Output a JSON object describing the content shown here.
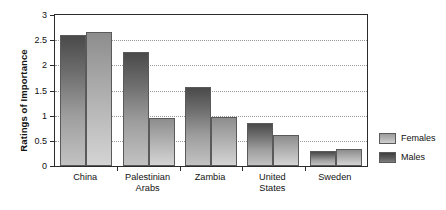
{
  "chart_data": {
    "type": "bar",
    "title": "",
    "xlabel": "",
    "ylabel": "Ratings of Importance",
    "categories": [
      "China",
      "Palestinian Arabs",
      "Zambia",
      "United States",
      "Sweden"
    ],
    "category_lines": [
      [
        "China"
      ],
      [
        "Palestinian",
        "Arabs"
      ],
      [
        "Zambia"
      ],
      [
        "United",
        "States"
      ],
      [
        "Sweden"
      ]
    ],
    "series": [
      {
        "name": "Males",
        "values": [
          2.6,
          2.27,
          1.57,
          0.85,
          0.3
        ],
        "color": "#6d6d6d"
      },
      {
        "name": "Females",
        "values": [
          2.66,
          0.95,
          0.97,
          0.62,
          0.33
        ],
        "color": "#b4b4b4"
      }
    ],
    "ylim": [
      0,
      3
    ],
    "yticks": [
      0,
      0.5,
      1,
      1.5,
      2,
      2.5,
      3
    ],
    "ytick_labels": [
      "0",
      "0.5",
      "1",
      "1.5",
      "2",
      "2.5",
      "3"
    ],
    "grid": true,
    "grid_style": "dotted",
    "legend_position": "right",
    "legend_entries": [
      "Females",
      "Males"
    ]
  }
}
